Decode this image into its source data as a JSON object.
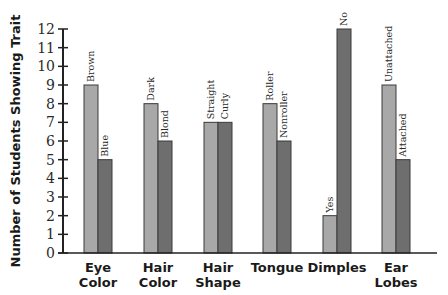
{
  "chart_data": {
    "type": "bar",
    "title": "",
    "xlabel": "",
    "ylabel": "Number of Students Showing Trait",
    "ylim": [
      0,
      12
    ],
    "yticks": [
      0,
      1,
      2,
      3,
      4,
      5,
      6,
      7,
      8,
      9,
      10,
      11,
      12
    ],
    "grid": false,
    "legend": "none (bars labeled individually)",
    "categories": [
      "Eye Color",
      "Hair Color",
      "Hair Shape",
      "Tongue",
      "Dimples",
      "Ear Lobes"
    ],
    "category_lines": [
      [
        "Eye",
        "Color"
      ],
      [
        "Hair",
        "Color"
      ],
      [
        "Hair",
        "Shape"
      ],
      [
        "Tongue"
      ],
      [
        "Dimples"
      ],
      [
        "Ear",
        "Lobes"
      ]
    ],
    "series": [
      {
        "name": "Trait A (light bars)",
        "color": "#a8a8a8",
        "labels": [
          "Brown",
          "Dark",
          "Straight",
          "Roller",
          "Yes",
          "Unattached"
        ],
        "values": [
          9,
          8,
          7,
          8,
          2,
          9
        ]
      },
      {
        "name": "Trait B (dark bars)",
        "color": "#6e6e6e",
        "labels": [
          "Blue",
          "Blond",
          "Curly",
          "Nonroller",
          "No",
          "Attached"
        ],
        "values": [
          5,
          6,
          7,
          6,
          12,
          5
        ]
      }
    ]
  }
}
